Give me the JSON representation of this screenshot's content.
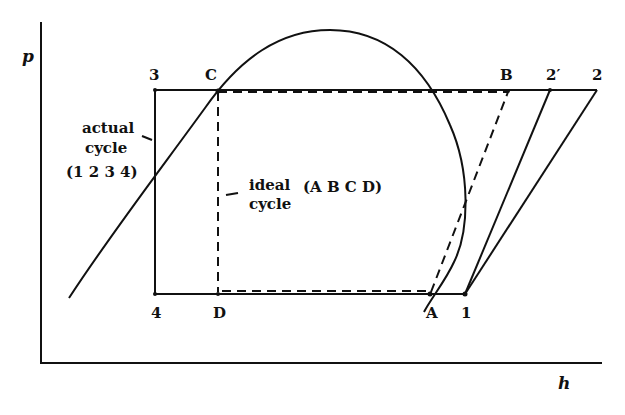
{
  "figure": {
    "type": "p-h diagram (vapor-compression refrigeration cycle)",
    "axes": {
      "y_label": "p",
      "x_label": "h"
    },
    "points": {
      "p3": "3",
      "pC": "C",
      "pB": "B",
      "p2prime": "2′",
      "p2": "2",
      "p4": "4",
      "pD": "D",
      "pA": "A",
      "p1": "1"
    },
    "annotations": {
      "actual_line1": "actual",
      "actual_line2": "cycle",
      "actual_line3": "(1 2 3 4)",
      "ideal_line1": "ideal",
      "ideal_line2": "cycle",
      "ideal_line3": "(A B C D)"
    },
    "cycles": [
      {
        "name": "actual cycle",
        "points": [
          "1",
          "2",
          "3",
          "4"
        ],
        "style": "solid"
      },
      {
        "name": "ideal cycle",
        "points": [
          "A",
          "B",
          "C",
          "D"
        ],
        "style": "dashed"
      }
    ],
    "colors": {
      "line": "#111111",
      "background": "#ffffff"
    }
  }
}
